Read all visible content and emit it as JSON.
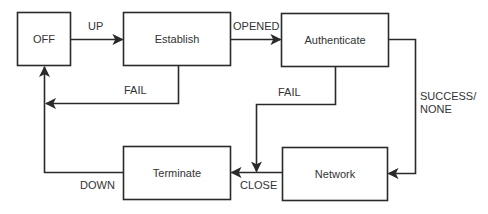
{
  "diagram": {
    "type": "state-machine",
    "colors": {
      "stroke": "#2a2a2a",
      "text": "#333333",
      "background": "#ffffff"
    },
    "states": {
      "off": {
        "label": "OFF"
      },
      "establish": {
        "label": "Establish"
      },
      "authenticate": {
        "label": "Authenticate"
      },
      "network": {
        "label": "Network"
      },
      "terminate": {
        "label": "Terminate"
      }
    },
    "transitions": {
      "up": {
        "label": "UP",
        "from": "OFF",
        "to": "Establish"
      },
      "opened": {
        "label": "OPENED",
        "from": "Establish",
        "to": "Authenticate"
      },
      "establish_fail": {
        "label": "FAIL",
        "from": "Establish",
        "to": "OFF"
      },
      "auth_fail": {
        "label": "FAIL",
        "from": "Authenticate",
        "to": "Terminate"
      },
      "success": {
        "label_line1": "SUCCESS/",
        "label_line2": "NONE",
        "from": "Authenticate",
        "to": "Network"
      },
      "close": {
        "label": "CLOSE",
        "from": "Network",
        "to": "Terminate"
      },
      "down": {
        "label": "DOWN",
        "from": "Terminate",
        "to": "OFF"
      }
    }
  }
}
